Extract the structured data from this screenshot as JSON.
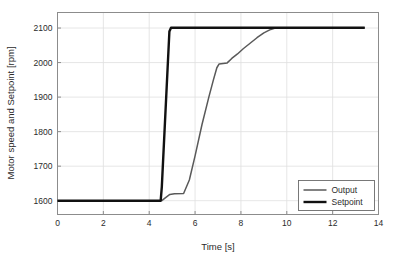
{
  "chart_data": {
    "type": "line",
    "title": "",
    "xlabel": "Time [s]",
    "ylabel": "Motor speed and Setpoint [rpm]",
    "xlim": [
      0,
      14
    ],
    "ylim": [
      1560,
      2145
    ],
    "xticks": [
      0,
      2,
      4,
      6,
      8,
      10,
      12,
      14
    ],
    "yticks": [
      1600,
      1700,
      1800,
      1900,
      2000,
      2100
    ],
    "xtick_labels": [
      "0",
      "2",
      "4",
      "6",
      "8",
      "10",
      "12",
      "14"
    ],
    "ytick_labels": [
      "1600",
      "1700",
      "1800",
      "1900",
      "2000",
      "2100"
    ],
    "grid": true,
    "legend_position": "lower right",
    "series": [
      {
        "name": "Output",
        "color": "#595959",
        "width": 1.5,
        "x": [
          0.0,
          4.55,
          4.7,
          4.9,
          5.1,
          5.5,
          5.75,
          6.0,
          6.3,
          6.6,
          6.8,
          6.95,
          7.05,
          7.4,
          7.6,
          7.85,
          8.1,
          8.4,
          8.7,
          9.0,
          9.3,
          9.5,
          10.0,
          11.0,
          12.0,
          13.0,
          13.4
        ],
        "y": [
          1600,
          1600,
          1608,
          1618,
          1620,
          1621,
          1660,
          1730,
          1820,
          1900,
          1950,
          1985,
          1996,
          1999,
          2012,
          2025,
          2040,
          2056,
          2072,
          2086,
          2096,
          2100,
          2101,
          2101,
          2101,
          2101,
          2101
        ]
      },
      {
        "name": "Setpoint",
        "color": "#111111",
        "width": 2.4,
        "x": [
          0.0,
          4.5,
          4.55,
          4.88,
          4.95,
          13.4
        ],
        "y": [
          1600,
          1600,
          1640,
          2090,
          2101,
          2101
        ]
      }
    ]
  },
  "legend": {
    "entries": [
      {
        "label": "Output",
        "color": "#595959",
        "width": 1.5
      },
      {
        "label": "Setpoint",
        "color": "#111111",
        "width": 2.4
      }
    ]
  },
  "colors": {
    "background": "#ffffff",
    "axis": "#8c8c8c",
    "grid": "#e0e0e0",
    "text": "#2b2b2b",
    "output": "#595959",
    "setpoint": "#111111"
  }
}
